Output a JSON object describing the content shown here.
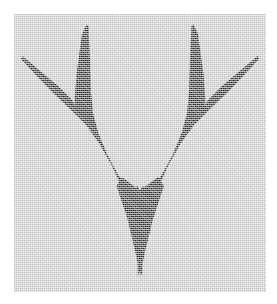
{
  "canvas": {
    "width": 277,
    "height": 304,
    "background_color": "#ffffff",
    "caption": ""
  },
  "panel": {
    "name": "image-panel",
    "x": 14,
    "y": 14,
    "width": 252,
    "height": 278,
    "background_color": "#d6d6d6",
    "texture": "dithered-halftone-grain",
    "border": "none"
  },
  "figure": {
    "name": "antler-silhouette",
    "fill_color": "#2e2e2e",
    "prongs": [
      {
        "label": "outer-left-spike",
        "tip_x": 24,
        "tip_y": 58
      },
      {
        "label": "inner-left-spike",
        "tip_x": 89,
        "tip_y": 25
      },
      {
        "label": "inner-right-spike",
        "tip_x": 188,
        "tip_y": 25
      },
      {
        "label": "outer-right-spike",
        "tip_x": 255,
        "tip_y": 56
      }
    ],
    "junctions": [
      {
        "label": "left-fork",
        "x": 78,
        "y": 124
      },
      {
        "label": "right-fork",
        "x": 197,
        "y": 124
      },
      {
        "label": "center-notch",
        "x": 137,
        "y": 188
      }
    ],
    "base_point": {
      "label": "bottom-tip",
      "x": 142,
      "y": 275
    },
    "path": "M 10 44 L 52 82 L 70 101 L 74 106 L 75 102 L 75 92 L 76 74 L 76 11 L 80 11 L 82 60 L 85 92 L 90 115 L 96 139 L 106 165 L 117 189 L 123 173 L 123 162 L 124 154 L 126 163 L 128 178 L 130 196 L 130 215 L 129 228 L 128 247 L 128 262 L 127 261 L 124 237 L 120 213 L 114 190 L 105 166 L 94 144 L 82 124 L 72 112 L 56 96 L 36 76 L 18 58 L 8 47 Z"
  },
  "labels": {
    "alt_text": "Antler-like dark silhouette on gray textured background"
  }
}
